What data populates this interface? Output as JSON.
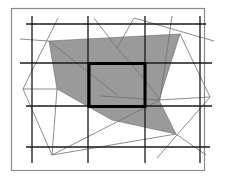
{
  "diagram": {
    "colors": {
      "background": "#ffffff",
      "frame": "#8c8c8c",
      "grid": "#1a1a1a",
      "polygon_fill": "#9a9a9a",
      "thin_lines": "#707070",
      "highlight": "#000000"
    },
    "grid": {
      "columns": 3,
      "rows": 3,
      "highlighted_cell": {
        "col": 1,
        "row": 1
      }
    },
    "components": [
      "frame",
      "grid-lines",
      "shaded-polygon",
      "highlight-rectangle",
      "triangulation-lines"
    ]
  }
}
